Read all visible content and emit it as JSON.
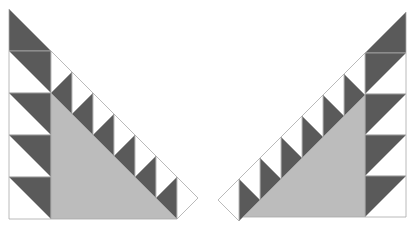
{
  "caption_clipped": "",
  "colors": {
    "dark": "#5a5a5a",
    "gray": "#bcbcbc",
    "white": "#ffffff",
    "outline": "#a8a8a8"
  },
  "figures": [
    {
      "name": "left-quilt-block",
      "mirror": false,
      "origin_x": 9,
      "origin_y": 9,
      "column_width": 42,
      "rows": 5,
      "teeth": 6,
      "tooth_width": 21
    },
    {
      "name": "right-quilt-block",
      "mirror": true,
      "origin_x": 406,
      "origin_y": 12,
      "column_width": 41,
      "rows": 5,
      "teeth": 6,
      "tooth_width": 21
    }
  ]
}
